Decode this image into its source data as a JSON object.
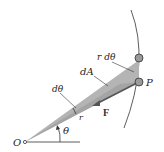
{
  "diagram": {
    "labels": {
      "origin": "O",
      "point": "P",
      "angle": "θ",
      "d_theta": "dθ",
      "arc_length": "r dθ",
      "area": "dA",
      "radius": "r",
      "force": "F"
    },
    "colors": {
      "wedge_fill": "#b4b4b4",
      "wedge_dark": "#8c8c8c",
      "line": "#333333",
      "particle": "#9a9a9a",
      "background": "#ffffff"
    }
  }
}
